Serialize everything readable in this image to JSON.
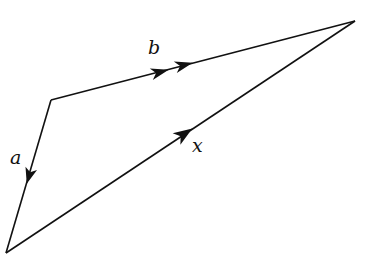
{
  "diagram": {
    "type": "vector-triangle",
    "stroke_color": "#111111",
    "background": "#ffffff",
    "vertices": {
      "P": [
        51,
        100
      ],
      "Q": [
        6,
        253
      ],
      "R": [
        355,
        21
      ]
    },
    "vectors": [
      {
        "name": "a",
        "label": "a",
        "from": "P",
        "to": "Q",
        "arrowheads": 1
      },
      {
        "name": "b",
        "label": "b",
        "from": "P",
        "to": "R",
        "arrowheads": 2
      },
      {
        "name": "x",
        "label": "x",
        "from": "Q",
        "to": "R",
        "arrowheads": 1
      }
    ],
    "labels": {
      "a": "a",
      "b": "b",
      "x": "x"
    }
  }
}
